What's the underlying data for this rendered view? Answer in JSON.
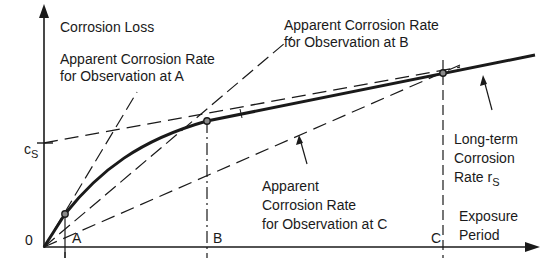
{
  "diagram": {
    "y_axis_label": "Corrosion Loss",
    "x_axis_label_line1": "Exposure",
    "x_axis_label_line2": "Period",
    "origin_label": "0",
    "cs_label_main": "c",
    "cs_label_sub": "S",
    "points": [
      {
        "label": "A"
      },
      {
        "label": "B"
      },
      {
        "label": "C"
      }
    ],
    "annotations": {
      "rate_a_line1": "Apparent Corrosion Rate",
      "rate_a_line2": "for Observation at A",
      "rate_b_line1": "Apparent Corrosion Rate",
      "rate_b_line2": "for Observation at B",
      "rate_c_line1": "Apparent",
      "rate_c_line2": "Corrosion Rate",
      "rate_c_line3": "for Observation at C",
      "longterm_line1": "Long-term",
      "longterm_line2": "Corrosion",
      "longterm_line3_main": "Rate r",
      "longterm_line3_sub": "S"
    },
    "colors": {
      "ink": "#1a1a1a",
      "background": "#ffffff"
    }
  }
}
